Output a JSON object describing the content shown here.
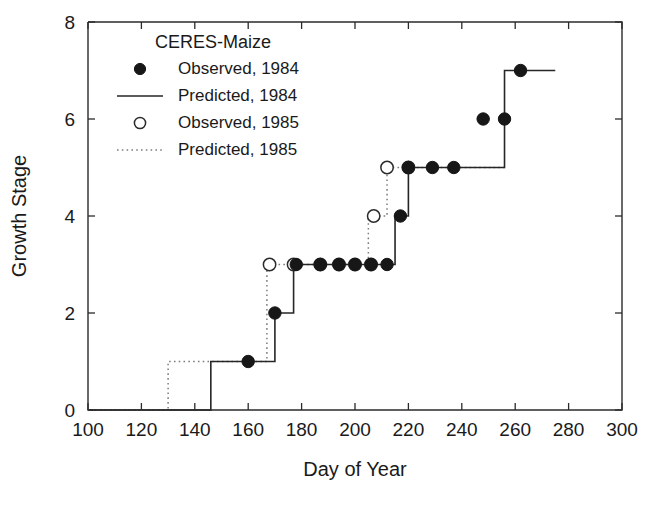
{
  "chart_data": {
    "type": "line",
    "title": "",
    "xlabel": "Day of Year",
    "ylabel": "Growth Stage",
    "xlim": [
      100,
      300
    ],
    "ylim": [
      0,
      8
    ],
    "xticks": [
      100,
      120,
      140,
      160,
      180,
      200,
      220,
      240,
      260,
      280,
      300
    ],
    "yticks": [
      0,
      2,
      4,
      6,
      8
    ],
    "grid": false,
    "legend_position": "upper-left-inside",
    "legend_title": "CERES-Maize",
    "legend_entries": [
      {
        "label": "Observed, 1984",
        "marker": "filled-circle",
        "line": "none"
      },
      {
        "label": "Predicted, 1984",
        "marker": "none",
        "line": "solid"
      },
      {
        "label": "Observed, 1985",
        "marker": "open-circle",
        "line": "none"
      },
      {
        "label": "Predicted, 1985",
        "marker": "none",
        "line": "dotted"
      }
    ],
    "series": [
      {
        "name": "Predicted, 1984",
        "style": "solid-step",
        "x": [
          100,
          146,
          146,
          170,
          170,
          177,
          177,
          215,
          215,
          220,
          220,
          256,
          256,
          275
        ],
        "y": [
          0,
          0,
          1,
          1,
          2,
          2,
          3,
          3,
          4,
          4,
          5,
          5,
          7,
          7
        ]
      },
      {
        "name": "Predicted, 1985",
        "style": "dotted-step",
        "x": [
          100,
          130,
          130,
          167,
          167,
          205,
          205,
          212,
          212,
          256
        ],
        "y": [
          0,
          0,
          1,
          1,
          3,
          3,
          4,
          4,
          5,
          5
        ]
      },
      {
        "name": "Observed, 1984",
        "style": "filled-circle-markers",
        "x": [
          160,
          170,
          178,
          187,
          194,
          200,
          206,
          212,
          217,
          220,
          229,
          237,
          248,
          256,
          262
        ],
        "y": [
          1,
          2,
          3,
          3,
          3,
          3,
          3,
          3,
          4,
          5,
          5,
          5,
          6,
          6,
          7
        ]
      },
      {
        "name": "Observed, 1985",
        "style": "open-circle-markers",
        "x": [
          168,
          177,
          187,
          194,
          200,
          206,
          207,
          212,
          220
        ],
        "y": [
          3,
          3,
          3,
          3,
          3,
          3,
          4,
          5,
          5
        ]
      }
    ]
  },
  "axes": {
    "x_title": "Day of Year",
    "y_title": "Growth Stage"
  },
  "colors": {
    "line_1984": "#262626",
    "line_1985": "#7d7d7d",
    "marker_fill": "#171717",
    "marker_open_stroke": "#2b2b2b",
    "axis": "#2b2b2b",
    "background": "#ffffff"
  }
}
